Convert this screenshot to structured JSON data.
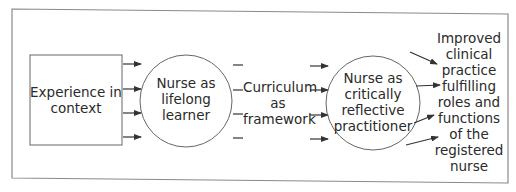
{
  "diagram": {
    "type": "flow",
    "nodes": {
      "experience": {
        "shape": "rectangle",
        "lines": [
          "Experience in",
          "context"
        ]
      },
      "lifelong": {
        "shape": "circle",
        "lines": [
          "Nurse as",
          "lifelong",
          "learner"
        ]
      },
      "curriculum": {
        "shape": "text",
        "lines": [
          "Curriculum",
          "as",
          "framework"
        ]
      },
      "reflective": {
        "shape": "circle",
        "lines": [
          "Nurse as",
          "critically",
          "reflective",
          "practitioner"
        ]
      },
      "outcome": {
        "shape": "text",
        "lines": [
          "Improved",
          "clinical",
          "practice",
          "fulfilling",
          "roles and",
          "functions",
          "of the",
          "registered",
          "nurse"
        ]
      }
    },
    "edges": [
      {
        "from": "experience",
        "to": "lifelong",
        "count": 4,
        "style": "arrow"
      },
      {
        "from": "lifelong",
        "to": "curriculum",
        "count": 4,
        "style": "dash"
      },
      {
        "from": "curriculum",
        "to": "reflective",
        "count": 4,
        "style": "arrow"
      },
      {
        "from": "reflective",
        "to": "outcome",
        "count": 4,
        "style": "arrow"
      }
    ],
    "colors": {
      "line": "#555555",
      "frame": "#8a8a8a",
      "text": "#2a2a2a",
      "background": "#ffffff"
    }
  }
}
